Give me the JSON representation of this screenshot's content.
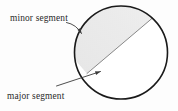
{
  "figure": {
    "background_color": "#fdfdfd"
  },
  "circle": {
    "name": "circle-outline",
    "center_x": 121,
    "center_y": 52.5,
    "radius": 46.5,
    "stroke_color": "#1a1a1a",
    "stroke_width": 1.6,
    "fill_color": "#ffffff"
  },
  "chord": {
    "name": "chord-line",
    "x1": 152.5,
    "y1": 18.0,
    "x2": 87.0,
    "y2": 73.5,
    "stroke_color": "#6e6e6e",
    "stroke_width": 0.8
  },
  "segments": {
    "minor": {
      "name": "minor-segment-region",
      "fill_color": "#e9e9e9",
      "description": "shaded upper-left region cut off by the chord"
    },
    "major": {
      "name": "major-segment-region",
      "fill_color": "#ffffff",
      "description": "unshaded lower-right region of the circle"
    }
  },
  "labels": {
    "minor": {
      "text": "minor segment",
      "x": 10,
      "y": 21,
      "anchor": "start"
    },
    "major": {
      "text": "major segment",
      "x": 7,
      "y": 99,
      "anchor": "start"
    }
  },
  "leaders": {
    "minor": {
      "name": "minor-segment-leader-arrow",
      "path": "M 66.5 22.5 Q 76.5 24.5 81.5 33.5",
      "stroke_color": "#3a3a3a",
      "stroke_width": 0.9,
      "arrow_tip_x": 81.5,
      "arrow_tip_y": 33.5,
      "arrow_angle_deg": 61
    },
    "major": {
      "name": "major-segment-leader-arrow",
      "path": "M 56.5 86.0 L 100.5 71.5",
      "stroke_color": "#3a3a3a",
      "stroke_width": 0.9,
      "arrow_tip_x": 100.5,
      "arrow_tip_y": 71.5,
      "arrow_angle_deg": -18
    }
  },
  "colors": {
    "ink": "#1a1a1a",
    "shade": "#e9e9e9",
    "leader": "#3a3a3a",
    "chord": "#6e6e6e"
  }
}
